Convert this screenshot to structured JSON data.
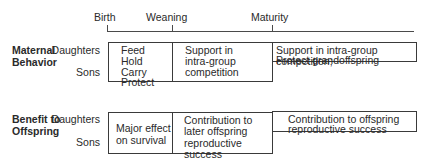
{
  "timeline": {
    "milestones": [
      {
        "label": "Birth",
        "x": 107
      },
      {
        "label": "Weaning",
        "x": 172
      },
      {
        "label": "Maturity",
        "x": 272
      }
    ]
  },
  "sections": [
    {
      "title_line1": "Maternal",
      "title_line2": "Behavior",
      "row_labels": [
        "Daughters",
        "Sons"
      ],
      "cells": [
        {
          "lines": [
            "Feed",
            "Hold",
            "Carry",
            "Protect"
          ]
        },
        {
          "lines": [
            "Support in",
            "intra-group",
            "competition"
          ]
        },
        {
          "lines": [
            "Support in intra-group competition;",
            "Protect grandoffspring"
          ]
        }
      ]
    },
    {
      "title_line1": "Benefit to",
      "title_line2": "Offspring",
      "row_labels": [
        "Daughters",
        "Sons"
      ],
      "cells": [
        {
          "lines": [
            "Major effect",
            "on survival"
          ]
        },
        {
          "lines": [
            "Contribution to",
            "later offspring",
            "reproductive success"
          ]
        },
        {
          "lines": [
            "Contribution to offspring",
            "reproductive success"
          ]
        }
      ]
    }
  ]
}
